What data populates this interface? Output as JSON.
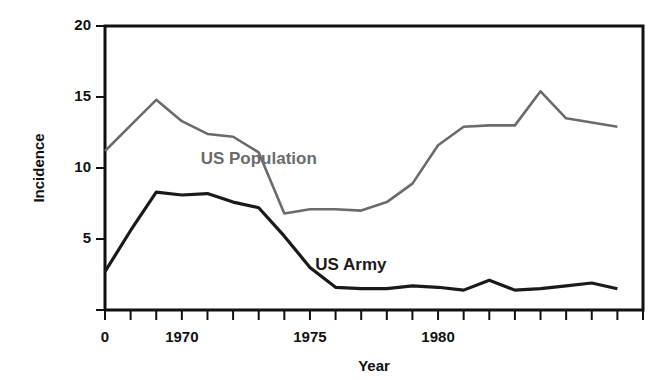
{
  "chart_data": {
    "type": "line",
    "title": "",
    "xlabel": "Year",
    "ylabel": "Incidence",
    "xlim": [
      1967,
      1988
    ],
    "ylim": [
      0,
      20
    ],
    "grid": false,
    "legend_position": "inline-annotation",
    "y_ticks": [
      0,
      5,
      10,
      15,
      20
    ],
    "y_tick_labels": [
      "",
      "5",
      "10",
      "15",
      "20"
    ],
    "x_ticks": [
      1967,
      1968,
      1969,
      1970,
      1971,
      1972,
      1973,
      1974,
      1975,
      1976,
      1977,
      1978,
      1979,
      1980,
      1981,
      1982,
      1983,
      1984,
      1985,
      1986,
      1987,
      1988
    ],
    "x_tick_labels": [
      "0",
      "",
      "",
      "1970",
      "",
      "",
      "",
      "",
      "1975",
      "",
      "",
      "",
      "",
      "1980",
      "",
      "",
      "",
      "",
      "",
      "",
      "",
      ""
    ],
    "x": [
      1967,
      1968,
      1969,
      1970,
      1971,
      1972,
      1973,
      1974,
      1975,
      1976,
      1977,
      1978,
      1979,
      1980,
      1981,
      1982,
      1983,
      1984,
      1985,
      1986,
      1987
    ],
    "series": [
      {
        "name": "US Population",
        "color": "#6b6b6b",
        "label_x": 1973.0,
        "label_y": 10.6,
        "values": [
          11.2,
          13.0,
          14.8,
          13.3,
          12.4,
          12.2,
          11.1,
          6.8,
          7.1,
          7.1,
          7.0,
          7.6,
          8.9,
          11.6,
          12.9,
          13.0,
          13.0,
          15.4,
          13.5,
          13.2,
          12.9
        ]
      },
      {
        "name": "US Army",
        "color": "#1a1a1a",
        "label_x": 1976.6,
        "label_y": 3.1,
        "values": [
          2.7,
          5.6,
          8.3,
          8.1,
          8.2,
          7.6,
          7.2,
          5.2,
          3.0,
          1.6,
          1.5,
          1.5,
          1.7,
          1.6,
          1.4,
          2.1,
          1.4,
          1.5,
          1.7,
          1.9,
          1.5
        ]
      }
    ]
  },
  "axis": {
    "y_label_text": "Incidence",
    "x_label_text": "Year"
  }
}
